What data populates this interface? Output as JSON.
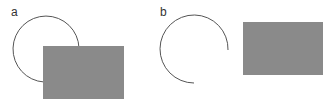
{
  "panels": [
    {
      "label": "a",
      "description": "arc occluded by rectangle",
      "arc": {
        "cx": 46,
        "cy": 49,
        "r": 33
      },
      "rect": {
        "x": 43,
        "y": 46,
        "w": 81,
        "h": 53
      }
    },
    {
      "label": "b",
      "description": "arc and rectangle separated",
      "arc": {
        "cx": 195,
        "cy": 49,
        "r": 34
      },
      "rect": {
        "x": 243,
        "y": 22,
        "w": 80,
        "h": 53
      }
    }
  ],
  "colors": {
    "arc_stroke": "#555555",
    "rect_fill": "#8a8a8a",
    "label": "#333333"
  }
}
